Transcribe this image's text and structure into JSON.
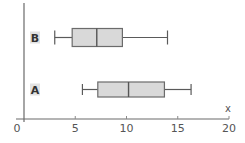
{
  "chart_data": {
    "type": "boxplot",
    "orientation": "horizontal",
    "title": "",
    "xlabel": "x",
    "ylabel": "",
    "xlim": [
      0,
      20
    ],
    "x_ticks": [
      0,
      5,
      10,
      15,
      20
    ],
    "x_tick_labels": [
      "0",
      "5",
      "10",
      "15",
      "20"
    ],
    "grid": false,
    "legend": null,
    "categories": [
      "B",
      "A"
    ],
    "series": [
      {
        "name": "B",
        "min": 3.0,
        "q1": 4.7,
        "median": 7.1,
        "q3": 9.6,
        "max": 14.0
      },
      {
        "name": "A",
        "min": 5.7,
        "q1": 7.2,
        "median": 10.2,
        "q3": 13.7,
        "max": 16.3
      }
    ]
  },
  "colors": {
    "box_fill": "#d9d9d9",
    "box_stroke": "#6b6b6b",
    "axis": "#6a6a6a",
    "label_bg": "#e2e2e2"
  }
}
